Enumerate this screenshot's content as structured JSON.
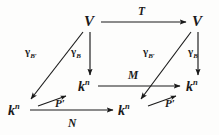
{
  "diagram": {
    "kind": "commutative-diagram",
    "ink_color": "#1a1a1a",
    "background_color": "#fdfdfc",
    "nodes": [
      {
        "id": "V-left",
        "label": "V",
        "base": "V",
        "sup": "",
        "x": 88,
        "y": 24
      },
      {
        "id": "V-right",
        "label": "V",
        "base": "V",
        "sup": "",
        "x": 196,
        "y": 24
      },
      {
        "id": "kn-mid-left",
        "label": "k n",
        "base": "k",
        "sup": "n",
        "x": 82,
        "y": 88
      },
      {
        "id": "kn-mid-right",
        "label": "k n",
        "base": "k",
        "sup": "n",
        "x": 190,
        "y": 88
      },
      {
        "id": "kn-bot-left",
        "label": "k n",
        "base": "k",
        "sup": "n",
        "x": 14,
        "y": 112
      },
      {
        "id": "kn-bot-right",
        "label": "k n",
        "base": "k",
        "sup": "n",
        "x": 124,
        "y": 112
      }
    ],
    "edges": [
      {
        "id": "edge-T",
        "label": "T",
        "from": "V-left",
        "to": "V-right",
        "style": "straight-horizontal"
      },
      {
        "id": "edge-M",
        "label": "M",
        "from": "kn-mid-left",
        "to": "kn-mid-right",
        "style": "straight-horizontal"
      },
      {
        "id": "edge-N",
        "label": "N",
        "from": "kn-bot-left",
        "to": "kn-bot-right",
        "style": "straight-horizontal"
      },
      {
        "id": "edge-gamma-Bprime-left",
        "label": "gamma B prime",
        "from": "V-left",
        "to": "kn-bot-left",
        "style": "diagonal"
      },
      {
        "id": "edge-gamma-B-left",
        "label": "gamma B",
        "from": "V-left",
        "to": "kn-mid-left",
        "style": "vertical"
      },
      {
        "id": "edge-gamma-Bprime-right",
        "label": "gamma B prime",
        "from": "V-right",
        "to": "kn-bot-right",
        "style": "diagonal"
      },
      {
        "id": "edge-gamma-B-right",
        "label": "gamma B",
        "from": "V-right",
        "to": "kn-mid-right",
        "style": "vertical"
      },
      {
        "id": "edge-P-left",
        "label": "P prime",
        "from": "kn-bot-left",
        "to": "kn-mid-left",
        "style": "short-diagonal"
      },
      {
        "id": "edge-P-right",
        "label": "P prime",
        "from": "kn-bot-right",
        "to": "kn-mid-right",
        "style": "short-diagonal"
      }
    ]
  },
  "labels": {
    "T": "T",
    "M": "M",
    "N": "N",
    "V": "V",
    "k": "k",
    "n": "n",
    "gamma": "γ",
    "sub_B": "B",
    "sub_Bprime": "B′",
    "P_left": "P′",
    "P_right": "P′"
  }
}
